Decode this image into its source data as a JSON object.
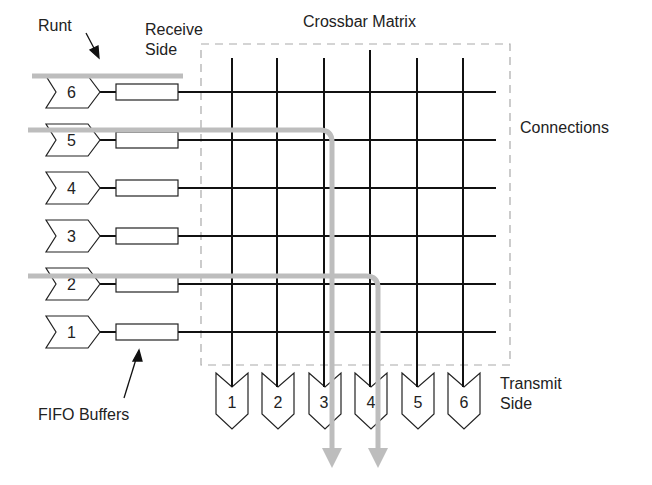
{
  "labels": {
    "runt": "Runt",
    "receive_side": "Receive\nSide",
    "crossbar_matrix": "Crossbar Matrix",
    "connections": "Connections",
    "transmit_side": "Transmit\nSide",
    "fifo_buffers": "FIFO Buffers"
  },
  "inputs": [
    "6",
    "5",
    "4",
    "3",
    "2",
    "1"
  ],
  "outputs": [
    "1",
    "2",
    "3",
    "4",
    "5",
    "6"
  ],
  "colors": {
    "line": "#111111",
    "dash": "#aaaaaa",
    "path": "#bdbdbd"
  }
}
